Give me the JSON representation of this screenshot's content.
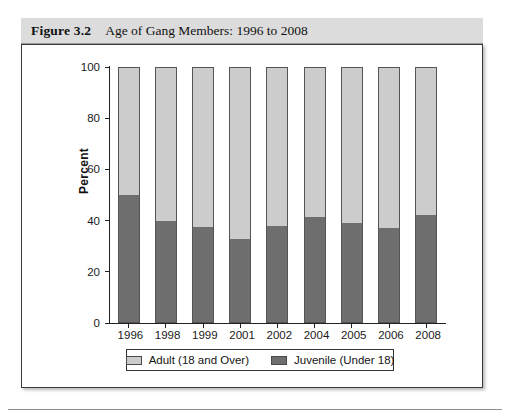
{
  "figure": {
    "label": "Figure 3.2",
    "title": "Age of Gang Members: 1996 to 2008"
  },
  "chart_data": {
    "type": "bar",
    "subtype": "stacked-100-percent",
    "title": "Age of Gang Members: 1996 to 2008",
    "xlabel": "",
    "ylabel": "Percent",
    "ylim": [
      0,
      100
    ],
    "yticks": [
      0,
      20,
      40,
      60,
      80,
      100
    ],
    "grid": false,
    "legend_position": "bottom",
    "categories": [
      "1996",
      "1998",
      "1999",
      "2001",
      "2002",
      "2004",
      "2005",
      "2006",
      "2008"
    ],
    "series": [
      {
        "name": "Juvenile (Under 18)",
        "color": "#6e6e6e",
        "values": [
          50,
          40,
          37.5,
          33,
          38,
          41.5,
          39,
          37,
          42
        ]
      },
      {
        "name": "Adult (18 and Over)",
        "color": "#cccccc",
        "values": [
          50,
          60,
          62.5,
          67,
          62,
          58.5,
          61,
          63,
          58
        ]
      }
    ]
  },
  "legend": {
    "items": [
      {
        "label": "Adult (18 and Over)",
        "color": "#cccccc"
      },
      {
        "label": "Juvenile (Under 18)",
        "color": "#6e6e6e"
      }
    ]
  }
}
